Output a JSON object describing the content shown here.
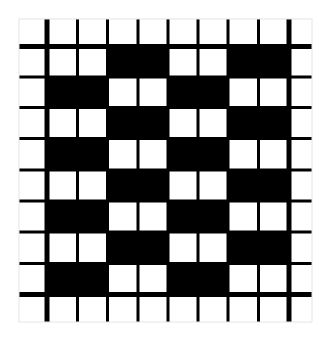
{
  "figure": {
    "type": "weave-draft-grid",
    "colors": {
      "background": "#ffffff",
      "filled": "#000000",
      "grid_line": "#000000",
      "frame": "#e4e4e4"
    },
    "columns_x": [
      19,
      47,
      77.5,
      107.5,
      138,
      168,
      198,
      228,
      258.5,
      289,
      312
    ],
    "rows_y": [
      19,
      46.5,
      77,
      107.5,
      138.5,
      170,
      201,
      232,
      263.5,
      294.5,
      322
    ],
    "thick_columns": [
      1,
      9
    ],
    "thick_rows": [
      1,
      9
    ],
    "thin_width": 3,
    "thick_width": 5,
    "grid": [
      [
        0,
        0,
        0,
        0,
        0,
        0,
        0,
        0,
        0,
        0
      ],
      [
        0,
        0,
        0,
        1,
        1,
        0,
        0,
        1,
        1,
        0
      ],
      [
        0,
        1,
        1,
        0,
        0,
        1,
        1,
        0,
        0,
        0
      ],
      [
        0,
        0,
        0,
        1,
        1,
        0,
        0,
        1,
        1,
        0
      ],
      [
        0,
        1,
        1,
        0,
        0,
        1,
        1,
        0,
        0,
        0
      ],
      [
        0,
        0,
        0,
        1,
        1,
        0,
        0,
        1,
        1,
        0
      ],
      [
        0,
        1,
        1,
        0,
        0,
        1,
        1,
        0,
        0,
        0
      ],
      [
        0,
        0,
        0,
        1,
        1,
        0,
        0,
        1,
        1,
        0
      ],
      [
        0,
        1,
        1,
        0,
        0,
        1,
        1,
        0,
        0,
        0
      ],
      [
        0,
        0,
        0,
        0,
        0,
        0,
        0,
        0,
        0,
        0
      ]
    ]
  }
}
